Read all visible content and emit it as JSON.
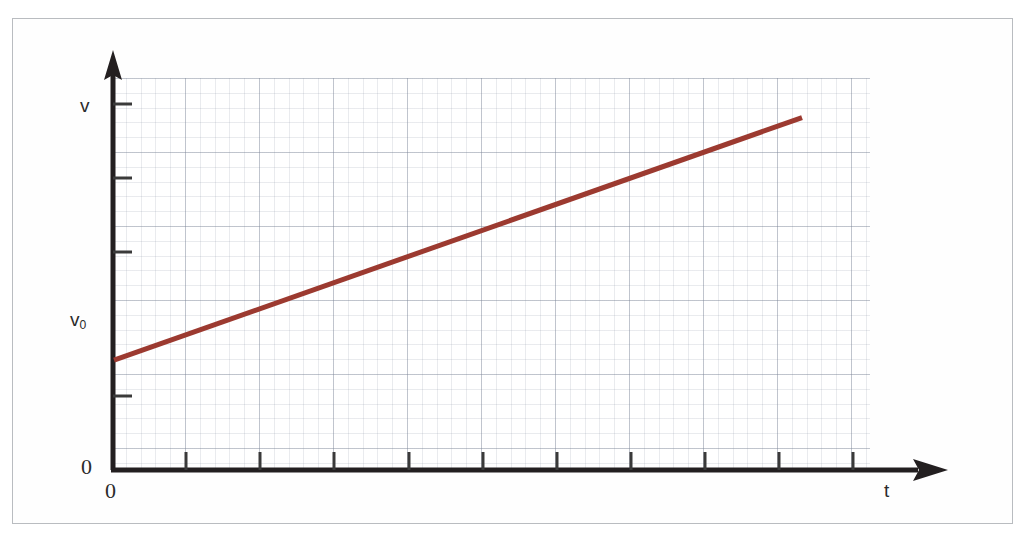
{
  "figure": {
    "background_color": "#ffffff",
    "frame_color": "#b9bcc0"
  },
  "axes": {
    "y_axis": {
      "name": "vertical-axis",
      "label": "v",
      "origin_label": "0",
      "intercept_label": "v",
      "intercept_subscript": "0",
      "color": "#231f20",
      "arrow": "up"
    },
    "x_axis": {
      "name": "horizontal-axis",
      "label": "t",
      "origin_label": "0",
      "color": "#231f20",
      "arrow": "right"
    }
  },
  "chart_data": {
    "type": "line",
    "title": "",
    "subtitle": "",
    "xlabel": "t",
    "ylabel": "v",
    "grid": true,
    "grid_style": "graph-paper",
    "legend": "none",
    "xlim": [
      0,
      10
    ],
    "ylim": [
      0,
      10
    ],
    "x_tick_labels": [
      "0"
    ],
    "y_tick_labels": [
      "0",
      "v₀",
      "v"
    ],
    "annotations": [
      {
        "text": "v₀",
        "x": 0,
        "y": 2.8,
        "note": "initial velocity, y-intercept"
      },
      {
        "text": "v",
        "x": 0,
        "y": 9.3,
        "note": "velocity axis name"
      },
      {
        "text": "t",
        "x": 9.9,
        "y": 0,
        "note": "time axis name"
      },
      {
        "text": "0",
        "x": 0,
        "y": 0,
        "note": "origin on vertical axis"
      },
      {
        "text": "0",
        "x": 0,
        "y": 0,
        "note": "origin on horizontal axis"
      }
    ],
    "series": [
      {
        "name": "velocity",
        "color": "#9c3a30",
        "linewidth": 5,
        "x": [
          0.0,
          9.1
        ],
        "y": [
          2.8,
          8.99
        ],
        "equation": "v = v₀ + a t",
        "slope": 0.68,
        "intercept": 2.8
      }
    ]
  },
  "colors": {
    "line": "#9c3a30",
    "axis": "#231f20",
    "grid_major": "#6e7c8c",
    "grid_minor": "#7886a0",
    "text": "#2b2b2b",
    "frame": "#b9bcc0"
  }
}
